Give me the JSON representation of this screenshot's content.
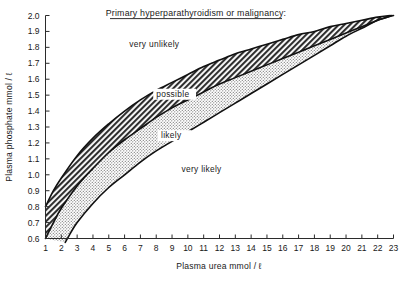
{
  "chart_data": {
    "type": "area",
    "title": "Primary hyperparathyroidism or malignancy:",
    "xlabel": "Plasma urea mmol / ℓ",
    "ylabel": "Plasma phosphate mmol / ℓ",
    "xlim": [
      1,
      23
    ],
    "ylim": [
      0.6,
      2.0
    ],
    "grid": false,
    "legend_position": "in-plot-annotations",
    "xticks": [
      "1",
      "2",
      "3",
      "4",
      "5",
      "6",
      "7",
      "8",
      "9",
      "10",
      "11",
      "12",
      "13",
      "14",
      "15",
      "16",
      "17",
      "18",
      "19",
      "20",
      "21",
      "22",
      "23"
    ],
    "yticks": [
      "0.6",
      "0.7",
      "0.8",
      "0.9",
      "1.0",
      "1.1",
      "1.2",
      "1.3",
      "1.4",
      "1.5",
      "1.6",
      "1.7",
      "1.8",
      "1.9",
      "2.0"
    ],
    "zones": [
      {
        "name": "very unlikely",
        "fill": "none",
        "order": 1
      },
      {
        "name": "possible",
        "fill": "dark-hatch",
        "order": 2
      },
      {
        "name": "likely",
        "fill": "light-stipple",
        "order": 3
      },
      {
        "name": "very likely",
        "fill": "none",
        "order": 4
      }
    ],
    "annotations": [
      {
        "text": "very unlikely",
        "x": 6.3,
        "y": 1.8
      },
      {
        "text": "possible",
        "x": 8.0,
        "y": 1.49
      },
      {
        "text": "likely",
        "x": 8.3,
        "y": 1.23
      },
      {
        "text": "very likely",
        "x": 9.6,
        "y": 1.02
      }
    ],
    "series": [
      {
        "name": "upper boundary (very unlikely / possible)",
        "x": [
          1.0,
          1.5,
          2.0,
          3.0,
          4.0,
          5.0,
          6.0,
          7.0,
          8.0,
          9.0,
          10.0,
          11.0,
          12.0,
          13.0,
          14.0,
          15.0,
          16.0,
          17.0,
          18.0,
          19.0,
          20.0,
          21.0,
          22.0,
          22.8
        ],
        "y": [
          0.8,
          0.9,
          0.98,
          1.12,
          1.23,
          1.32,
          1.4,
          1.47,
          1.53,
          1.58,
          1.63,
          1.68,
          1.72,
          1.76,
          1.79,
          1.82,
          1.85,
          1.88,
          1.9,
          1.93,
          1.95,
          1.97,
          1.99,
          2.0
        ]
      },
      {
        "name": "middle boundary (possible / likely)",
        "x": [
          1.0,
          1.5,
          2.0,
          3.0,
          4.0,
          5.0,
          6.0,
          7.0,
          8.0,
          9.0,
          10.0,
          11.0,
          12.0,
          13.0,
          14.0,
          15.0,
          16.0,
          17.0,
          18.0,
          19.0,
          20.0,
          21.0,
          22.0,
          22.9
        ],
        "y": [
          0.6,
          0.7,
          0.79,
          0.93,
          1.04,
          1.14,
          1.22,
          1.29,
          1.36,
          1.42,
          1.47,
          1.52,
          1.57,
          1.61,
          1.65,
          1.69,
          1.73,
          1.77,
          1.81,
          1.85,
          1.89,
          1.93,
          1.97,
          2.0
        ]
      },
      {
        "name": "lower boundary (likely / very likely)",
        "x": [
          2.25,
          2.5,
          3.0,
          4.0,
          5.0,
          6.0,
          7.0,
          8.0,
          9.0,
          10.0,
          11.0,
          12.0,
          13.0,
          14.0,
          15.0,
          16.0,
          17.0,
          18.0,
          19.0,
          20.0,
          21.0,
          22.0,
          23.0
        ],
        "y": [
          0.575,
          0.62,
          0.7,
          0.82,
          0.92,
          1.0,
          1.08,
          1.15,
          1.21,
          1.27,
          1.33,
          1.39,
          1.45,
          1.51,
          1.57,
          1.63,
          1.69,
          1.75,
          1.81,
          1.87,
          1.92,
          1.97,
          2.0
        ]
      }
    ]
  },
  "colors": {
    "axis": "#2b2b2b",
    "curve": "#111111",
    "dark_band": "#3a3a3a",
    "light_band": "#9a9a9a",
    "background": "#ffffff"
  }
}
